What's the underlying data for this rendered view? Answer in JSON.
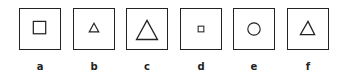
{
  "figure": {
    "panels": [
      {
        "label": "a",
        "shape": "square",
        "size": "medium",
        "x": 19,
        "w": 42
      },
      {
        "label": "b",
        "shape": "triangle",
        "size": "small",
        "x": 73,
        "w": 42
      },
      {
        "label": "c",
        "shape": "triangle",
        "size": "large",
        "x": 126,
        "w": 42
      },
      {
        "label": "d",
        "shape": "square",
        "size": "small",
        "x": 180,
        "w": 42
      },
      {
        "label": "e",
        "shape": "circle",
        "size": "medium",
        "x": 233,
        "w": 42
      },
      {
        "label": "f",
        "shape": "triangle",
        "size": "medium",
        "x": 287,
        "w": 42
      }
    ],
    "stroke_color": "#222222"
  }
}
